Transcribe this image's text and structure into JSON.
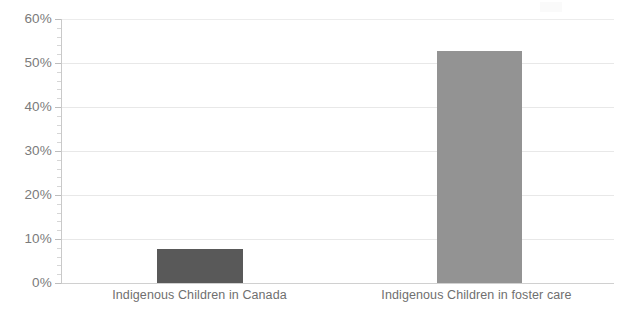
{
  "chart_data": {
    "type": "bar",
    "title": "",
    "subtitle": "",
    "xlabel": "",
    "ylabel": "",
    "categories": [
      "Indigenous Children in Canada",
      "Indigenous Children in foster care"
    ],
    "values": [
      7.7,
      52.8
    ],
    "value_labels": [
      "",
      ""
    ],
    "ylim": [
      0,
      60
    ],
    "ytick_values": [
      0,
      10,
      20,
      30,
      40,
      50,
      60
    ],
    "ytick_labels": [
      "0%",
      "10%",
      "20%",
      "30%",
      "40%",
      "50%",
      "60%"
    ],
    "y_minor_tick_interval": 2,
    "grid": {
      "horizontal": true,
      "vertical": false,
      "color": "#e8e8e8"
    },
    "legend": {
      "visible": false,
      "position": "none",
      "entries": []
    },
    "bar_colors": [
      "#595959",
      "#939393"
    ],
    "plot_background": "#ffffff",
    "axis_line_color": "#c9c9c9",
    "tick_label_color": "#7b7b7b",
    "category_label_color": "#6f6f6f",
    "annotations": []
  }
}
